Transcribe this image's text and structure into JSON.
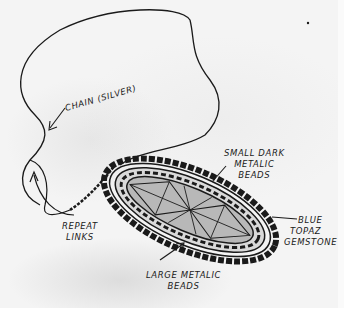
{
  "sketch": {
    "subject": "Pendant necklace design sketch",
    "colors": {
      "paper": "#f4f4f4",
      "ink": "#1a1a1a",
      "stone_shade": "#b8b8b8"
    }
  },
  "labels": {
    "chain": "Chain (Silver)",
    "repeat_links_line1": "Repeat",
    "repeat_links_line2": "Links",
    "small_beads_line1": "Small Dark",
    "small_beads_line2": "Metalic",
    "small_beads_line3": "Beads",
    "gemstone_line1": "Blue",
    "gemstone_line2": "Topaz",
    "gemstone_line3": "Gemstone",
    "large_beads_line1": "Large Metalic",
    "large_beads_line2": "Beads"
  }
}
